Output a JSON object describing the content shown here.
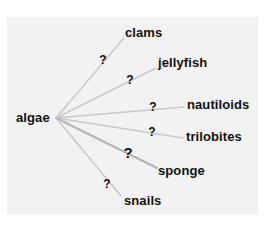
{
  "diagram": {
    "type": "food-web",
    "background_color": "#f2f2f2",
    "edge_color": "#c8c8c8",
    "edge_highlight_color": "#b4b4b4",
    "source": {
      "label": "algae",
      "x": 16,
      "y": 118
    },
    "hub": {
      "x": 56,
      "y": 118
    },
    "targets": [
      {
        "label": "clams",
        "x": 125,
        "y": 33,
        "end_x": 124,
        "end_y": 38,
        "q_x": 103,
        "q_y": 60,
        "q_label": "?",
        "q_big": false,
        "edge_width": 1.4
      },
      {
        "label": "jellyfish",
        "x": 158,
        "y": 63,
        "end_x": 156,
        "end_y": 68,
        "q_x": 130,
        "q_y": 80,
        "q_label": "?",
        "q_big": false,
        "edge_width": 1.4
      },
      {
        "label": "nautiloids",
        "x": 187,
        "y": 105,
        "end_x": 184,
        "end_y": 107,
        "q_x": 153,
        "q_y": 107,
        "q_label": "?",
        "q_big": false,
        "edge_width": 1.4
      },
      {
        "label": "trilobites",
        "x": 186,
        "y": 137,
        "end_x": 183,
        "end_y": 138,
        "q_x": 152,
        "q_y": 132,
        "q_label": "?",
        "q_big": false,
        "edge_width": 1.4
      },
      {
        "label": "sponge",
        "x": 158,
        "y": 171,
        "end_x": 157,
        "end_y": 168,
        "q_x": 128,
        "q_y": 153,
        "q_label": "?",
        "q_big": true,
        "edge_width": 2.0
      },
      {
        "label": "snails",
        "x": 124,
        "y": 201,
        "end_x": 121,
        "end_y": 196,
        "q_x": 107,
        "q_y": 184,
        "q_label": "?",
        "q_big": false,
        "edge_width": 1.4
      }
    ]
  }
}
